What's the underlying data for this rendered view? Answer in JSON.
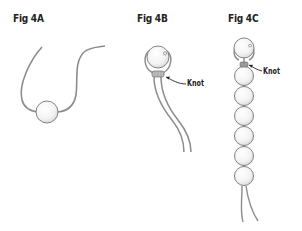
{
  "figures": [
    {
      "id": "4A",
      "title": "Fig 4A",
      "caption": "Single bead threaded on cord"
    },
    {
      "id": "4B",
      "title": "Fig 4B",
      "knot_label": "Knot"
    },
    {
      "id": "4C",
      "title": "Fig 4C",
      "knot_label": "Knot",
      "bead_count": 7
    }
  ],
  "colors": {
    "cord": "#8c8c8c",
    "bead_fill": "#f7f7f7",
    "bead_stroke": "#777777",
    "text": "#222222"
  }
}
